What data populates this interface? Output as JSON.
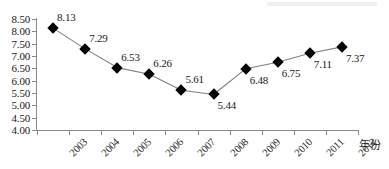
{
  "chart_data": {
    "type": "line",
    "title": "",
    "subtitle": "",
    "xlabel": "年份",
    "ylabel": "",
    "categories": [
      "2003",
      "2004",
      "2005",
      "2006",
      "2007",
      "2008",
      "2009",
      "2010",
      "2011",
      "2012"
    ],
    "values": [
      8.13,
      7.29,
      6.53,
      6.26,
      5.61,
      5.44,
      6.48,
      6.75,
      7.11,
      7.37
    ],
    "point_labels": [
      "8.13",
      "7.29",
      "6.53",
      "6.26",
      "5.61",
      "5.44",
      "6.48",
      "6.75",
      "7.11",
      "7.37"
    ],
    "label_positions": [
      "above",
      "above",
      "above",
      "above",
      "above",
      "below",
      "below",
      "below",
      "below",
      "below"
    ],
    "ylim": [
      4.0,
      8.5
    ],
    "ytick_step": 0.5,
    "ytick_labels": [
      "8.50",
      "8.00",
      "7.50",
      "7.00",
      "6.50",
      "6.00",
      "5.50",
      "5.00",
      "4.50",
      "4.00"
    ],
    "ytick_values": [
      8.5,
      8.0,
      7.5,
      7.0,
      6.5,
      6.0,
      5.5,
      5.0,
      4.5,
      4.0
    ],
    "grid": false,
    "legend": false,
    "legend_position": "none",
    "marker": "diamond",
    "marker_color": "#000000",
    "line_color": "#808080",
    "axis_color": "#8a8a8a",
    "text_color": "#1a1a1a",
    "background": "#ffffff",
    "xtick_label_rotation_deg": -45,
    "annotations": []
  }
}
